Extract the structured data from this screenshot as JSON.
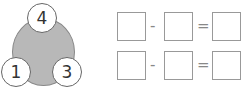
{
  "number_bond": {
    "whole": "4",
    "part_left": "1",
    "part_right": "3",
    "fill_color": "#b8b8b8"
  },
  "equations": [
    {
      "operator": "-",
      "equals": "="
    },
    {
      "operator": "-",
      "equals": "="
    }
  ]
}
